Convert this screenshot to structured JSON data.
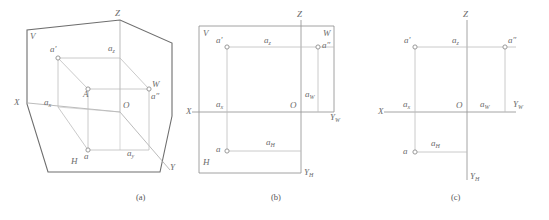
{
  "figure": {
    "colors": {
      "frame": "#6e6e6e",
      "line": "#b3b3b3",
      "axis": "#9a9a9a",
      "text": "#6b6b6b",
      "marker": "#8f8f8f",
      "background": "#ffffff"
    },
    "captions": [
      {
        "key": "a",
        "text": "(a)"
      },
      {
        "key": "b",
        "text": "(b)"
      },
      {
        "key": "c",
        "text": "(c)"
      }
    ]
  },
  "panel_a": {
    "name": "three-dimensional-pictorial-view",
    "labels": {
      "plane_v": "V",
      "plane_h": "H",
      "plane_w": "W",
      "axis_z": "Z",
      "axis_x": "X",
      "axis_y": "Y",
      "origin": "O",
      "point_A": "A",
      "proj_v": "a'",
      "proj_h": "a",
      "proj_w": "a″",
      "coord_x": "a",
      "coord_x_sub": "x",
      "coord_y": "a",
      "coord_y_sub": "y",
      "coord_z": "a",
      "coord_z_sub": "z"
    }
  },
  "panel_b": {
    "name": "unfolded-projection-planes",
    "labels": {
      "plane_v": "V",
      "plane_h": "H",
      "plane_w": "W",
      "axis_z": "Z",
      "axis_x": "X",
      "axis_y_h": "Y",
      "axis_y_h_sub": "H",
      "axis_y_w": "Y",
      "axis_y_w_sub": "W",
      "origin": "O",
      "proj_v": "a'",
      "proj_h": "a",
      "proj_w": "a″",
      "coord_x": "a",
      "coord_x_sub": "x",
      "coord_z": "a",
      "coord_z_sub": "z",
      "coord_y_h": "a",
      "coord_y_h_sub": "H",
      "coord_y_w": "a",
      "coord_y_w_sub": "W"
    }
  },
  "panel_c": {
    "name": "final-projection-drawing",
    "labels": {
      "axis_z": "Z",
      "axis_x": "X",
      "axis_y_h": "Y",
      "axis_y_h_sub": "H",
      "axis_y_w": "Y",
      "axis_y_w_sub": "W",
      "origin": "O",
      "proj_v": "a'",
      "proj_h": "a",
      "proj_w": "a″",
      "coord_x": "a",
      "coord_x_sub": "x",
      "coord_z": "a",
      "coord_z_sub": "z",
      "coord_y_h": "a",
      "coord_y_h_sub": "H",
      "coord_y_w": "a",
      "coord_y_w_sub": "W"
    }
  }
}
